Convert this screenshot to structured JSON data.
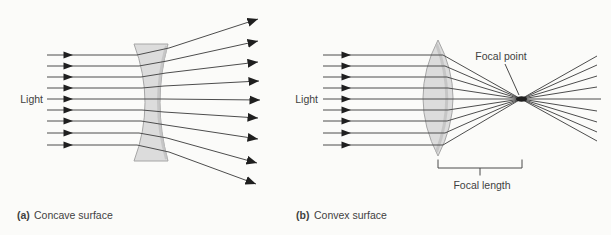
{
  "colors": {
    "background": "#fbfbf9",
    "ray": "#4d4d4d",
    "arrowhead": "#1f1f1f",
    "lens_fill": "#dcdcdc",
    "lens_fill_dark": "#c0c0c0",
    "lens_stroke": "#a6a6a6",
    "annotation_line": "#4a4a4a",
    "text": "#3f3f3f"
  },
  "panel_a": {
    "light_label": "Light",
    "caption_tag": "(a)",
    "caption_text": "Concave surface",
    "inline_arrow_x": 73,
    "rays": [
      {
        "points": [
          [
            47,
            55
          ],
          [
            137,
            55
          ],
          [
            169,
            48
          ],
          [
            258,
            19
          ]
        ]
      },
      {
        "points": [
          [
            47,
            66
          ],
          [
            139,
            66
          ],
          [
            167,
            61
          ],
          [
            258,
            41
          ]
        ]
      },
      {
        "points": [
          [
            47,
            77
          ],
          [
            141,
            77
          ],
          [
            166,
            73
          ],
          [
            258,
            62
          ]
        ]
      },
      {
        "points": [
          [
            47,
            88
          ],
          [
            142,
            88
          ],
          [
            164,
            86
          ],
          [
            259,
            81
          ]
        ]
      },
      {
        "points": [
          [
            47,
            99
          ],
          [
            143,
            99
          ],
          [
            163,
            99
          ],
          [
            260,
            100
          ]
        ]
      },
      {
        "points": [
          [
            47,
            110
          ],
          [
            142,
            110
          ],
          [
            164,
            112
          ],
          [
            258,
            118
          ]
        ]
      },
      {
        "points": [
          [
            47,
            121
          ],
          [
            141,
            121
          ],
          [
            166,
            125
          ],
          [
            258,
            139
          ]
        ]
      },
      {
        "points": [
          [
            47,
            133
          ],
          [
            139,
            133
          ],
          [
            167,
            138
          ],
          [
            257,
            163
          ]
        ]
      },
      {
        "points": [
          [
            47,
            145
          ],
          [
            137,
            145
          ],
          [
            169,
            152
          ],
          [
            256,
            184
          ]
        ]
      }
    ]
  },
  "panel_b": {
    "light_label": "Light",
    "focal_point_label": "Focal point",
    "focal_length_label": "Focal length",
    "caption_tag": "(b)",
    "caption_text": "Convex surface",
    "inline_arrow_x": 351,
    "focal_point": {
      "x": 521.5,
      "y": 99
    },
    "rays": [
      {
        "points": [
          [
            323,
            55
          ],
          [
            443,
            55
          ],
          [
            521,
            99
          ],
          [
            597,
            141
          ]
        ]
      },
      {
        "points": [
          [
            323,
            66
          ],
          [
            445,
            66
          ],
          [
            521,
            99
          ],
          [
            597,
            132
          ]
        ]
      },
      {
        "points": [
          [
            323,
            77
          ],
          [
            447,
            77
          ],
          [
            521,
            99
          ],
          [
            597,
            122
          ]
        ]
      },
      {
        "points": [
          [
            323,
            88
          ],
          [
            448,
            88
          ],
          [
            521,
            99
          ],
          [
            597,
            111
          ]
        ]
      },
      {
        "points": [
          [
            323,
            99
          ],
          [
            449,
            99
          ],
          [
            521,
            99
          ],
          [
            601,
            99
          ]
        ]
      },
      {
        "points": [
          [
            323,
            110
          ],
          [
            448,
            110
          ],
          [
            521,
            99
          ],
          [
            597,
            87
          ]
        ]
      },
      {
        "points": [
          [
            323,
            121
          ],
          [
            447,
            121
          ],
          [
            521,
            99
          ],
          [
            597,
            76
          ]
        ]
      },
      {
        "points": [
          [
            323,
            133
          ],
          [
            445,
            133
          ],
          [
            521,
            99
          ],
          [
            597,
            65
          ]
        ]
      },
      {
        "points": [
          [
            323,
            145
          ],
          [
            443,
            145
          ],
          [
            521,
            99
          ],
          [
            597,
            56
          ]
        ]
      }
    ]
  }
}
